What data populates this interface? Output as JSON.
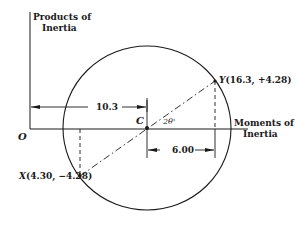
{
  "axes": {
    "y_label_line1": "Products of",
    "y_label_line2": "Inertia",
    "x_label_line1": "Moments of",
    "x_label_line2": "Inertia",
    "origin_label": "O"
  },
  "circle": {
    "center_label": "C",
    "angle_label": "2θ'"
  },
  "points": {
    "X": {
      "name": "X",
      "coords": "(4.30, −4.28)"
    },
    "Y": {
      "name": "Y",
      "coords": "(16.3, +4.28)"
    }
  },
  "dimensions": {
    "oc_distance": "10.3",
    "cy_horizontal": "6.00"
  },
  "colors": {
    "ink": "#1a1a1a",
    "background": "#ffffff"
  }
}
